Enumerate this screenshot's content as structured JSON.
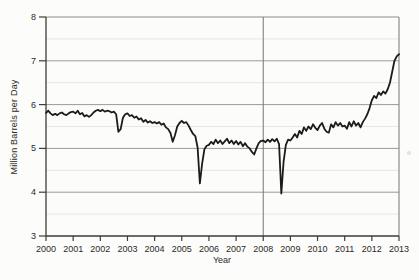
{
  "colors": {
    "background": "#fcfcfa",
    "data_line": "#1b1b1b",
    "axis": "#3c3c3a",
    "major_grid": "#9a9a96",
    "minor_grid": "#e6e6e2",
    "plot_border": "#8c8c88",
    "reference_line": "#77776f",
    "tick_text": "#2a2a28",
    "artifact": "#c9c9c4"
  },
  "chart_data": {
    "type": "line",
    "title": "",
    "xlabel": "Year",
    "ylabel": "Million Barrels per Day",
    "x_range": [
      2000,
      2013
    ],
    "ylim": [
      3,
      8
    ],
    "x_ticks": [
      2000,
      2001,
      2002,
      2003,
      2004,
      2005,
      2006,
      2007,
      2008,
      2009,
      2010,
      2011,
      2012,
      2013
    ],
    "x_tick_labels": [
      "2000",
      "2001",
      "2002",
      "2003",
      "2004",
      "2005",
      "2006",
      "2007",
      "2008",
      "2009",
      "2010",
      "2011",
      "2012",
      "2013"
    ],
    "y_ticks": [
      3,
      4,
      5,
      6,
      7,
      8
    ],
    "y_tick_labels": [
      "3",
      "4",
      "5",
      "6",
      "7",
      "8"
    ],
    "y_minor_ticks": [
      3.5,
      4.5,
      5.5,
      6.5,
      7.5
    ],
    "grid": "horizontal major (solid gray) and minor (light gray); no vertical grid",
    "legend": "none",
    "reference_line_x": 2008,
    "series": [
      {
        "name": "million-barrels-per-day",
        "frequency": "monthly",
        "start": "2000-01",
        "end": "2013-01",
        "values": [
          5.81,
          5.86,
          5.8,
          5.76,
          5.79,
          5.76,
          5.8,
          5.82,
          5.78,
          5.76,
          5.8,
          5.83,
          5.84,
          5.8,
          5.86,
          5.78,
          5.81,
          5.73,
          5.76,
          5.72,
          5.76,
          5.82,
          5.86,
          5.88,
          5.85,
          5.88,
          5.84,
          5.86,
          5.85,
          5.82,
          5.84,
          5.78,
          5.38,
          5.44,
          5.7,
          5.78,
          5.8,
          5.74,
          5.76,
          5.7,
          5.73,
          5.66,
          5.69,
          5.61,
          5.65,
          5.59,
          5.62,
          5.58,
          5.6,
          5.57,
          5.6,
          5.54,
          5.57,
          5.48,
          5.44,
          5.35,
          5.15,
          5.3,
          5.5,
          5.58,
          5.63,
          5.58,
          5.6,
          5.52,
          5.42,
          5.33,
          5.28,
          5.02,
          4.2,
          4.65,
          4.98,
          5.06,
          5.08,
          5.15,
          5.1,
          5.2,
          5.12,
          5.18,
          5.1,
          5.16,
          5.22,
          5.12,
          5.18,
          5.1,
          5.17,
          5.09,
          5.15,
          5.05,
          5.12,
          5.04,
          5.0,
          4.92,
          4.86,
          5.0,
          5.12,
          5.17,
          5.18,
          5.14,
          5.2,
          5.15,
          5.21,
          5.16,
          5.22,
          5.1,
          3.97,
          4.7,
          5.08,
          5.2,
          5.18,
          5.25,
          5.33,
          5.25,
          5.4,
          5.33,
          5.48,
          5.4,
          5.5,
          5.44,
          5.55,
          5.47,
          5.42,
          5.52,
          5.58,
          5.45,
          5.38,
          5.36,
          5.55,
          5.48,
          5.6,
          5.52,
          5.58,
          5.5,
          5.52,
          5.45,
          5.6,
          5.5,
          5.62,
          5.52,
          5.58,
          5.48,
          5.6,
          5.68,
          5.78,
          5.92,
          6.1,
          6.2,
          6.15,
          6.28,
          6.22,
          6.3,
          6.25,
          6.35,
          6.5,
          6.75,
          7.0,
          7.1,
          7.15
        ]
      }
    ]
  }
}
